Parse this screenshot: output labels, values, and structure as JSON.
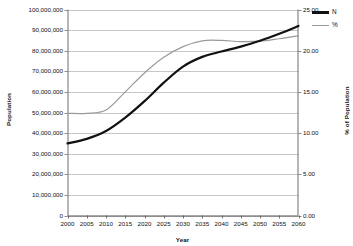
{
  "chart_data": {
    "type": "line",
    "title": "",
    "xlabel": "Year",
    "ylabel": "Population",
    "y2label": "% of Population",
    "grid": true,
    "legend_position": "right-top",
    "x": [
      2000,
      2005,
      2010,
      2015,
      2020,
      2025,
      2030,
      2035,
      2040,
      2045,
      2050,
      2055,
      2060
    ],
    "xticklabels": [
      "2000",
      "2005",
      "2010",
      "2015",
      "2020",
      "2025",
      "2030",
      "2035",
      "2040",
      "2045",
      "2050",
      "2055",
      "2060"
    ],
    "ylim": [
      0,
      100000000
    ],
    "yticks": [
      0,
      10000000,
      20000000,
      30000000,
      40000000,
      50000000,
      60000000,
      70000000,
      80000000,
      90000000,
      100000000
    ],
    "yticklabels": [
      "0",
      "10,000,000",
      "20,000,000",
      "30,000,000",
      "40,000,000",
      "50,000,000",
      "60,000,000",
      "70,000,000",
      "80,000,000",
      "90,000,000",
      "100,000,000"
    ],
    "y2lim": [
      0,
      25
    ],
    "y2ticks": [
      0,
      5,
      10,
      15,
      20,
      25
    ],
    "y2ticklabels": [
      "0.00",
      "5.00",
      "10.00",
      "15.00",
      "20.00",
      "25.00"
    ],
    "series": [
      {
        "name": "N",
        "axis": "left",
        "color": "#111111",
        "width": 2.2,
        "values": [
          35000000,
          37200000,
          41000000,
          47500000,
          55500000,
          64500000,
          72300000,
          77000000,
          79600000,
          82000000,
          84800000,
          88200000,
          92000000
        ]
      },
      {
        "name": "%",
        "axis": "right",
        "color": "#9a9a9a",
        "width": 1.2,
        "values": [
          12.4,
          12.4,
          12.8,
          15.0,
          17.3,
          19.2,
          20.5,
          21.2,
          21.25,
          21.1,
          21.15,
          21.45,
          21.8
        ]
      }
    ]
  },
  "legend": {
    "items": [
      {
        "label": "N"
      },
      {
        "label": "%"
      }
    ]
  },
  "colors": {
    "series_n": "#111111",
    "series_pct": "#9a9a9a",
    "grid": "#b9b9b9",
    "axis": "#6e6e6e",
    "background": "#ffffff"
  }
}
